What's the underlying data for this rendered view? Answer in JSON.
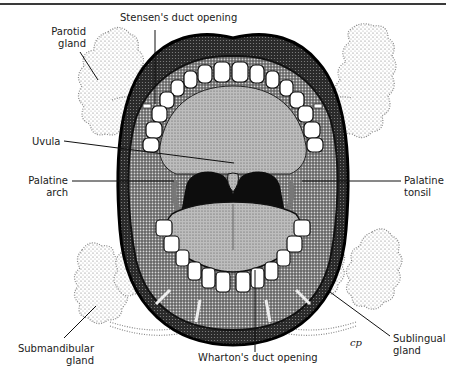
{
  "diagram": {
    "labels": {
      "stensens_duct": "Stensen's duct opening",
      "parotid_line1": "Parotid",
      "parotid_line2": "gland",
      "uvula": "Uvula",
      "palatine_arch_line1": "Palatine",
      "palatine_arch_line2": "arch",
      "palatine_tonsil_line1": "Palatine",
      "palatine_tonsil_line2": "tonsil",
      "submandibular_line1": "Submandibular",
      "submandibular_line2": "gland",
      "whartons_duct": "Wharton's duct opening",
      "sublingual_line1": "Sublingual",
      "sublingual_line2": "gland"
    },
    "signature": "CP",
    "colors": {
      "ink": "#111111",
      "stipple": "#555555",
      "teeth": "#ffffff",
      "tongue": "#9a9a9a",
      "background": "#ffffff"
    }
  }
}
